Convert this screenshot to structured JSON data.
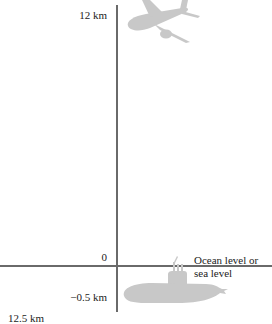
{
  "diagram": {
    "type": "vertical-number-line",
    "axis": {
      "top_label": "12 km",
      "zero_label": "0",
      "negative_label": "−0.5 km",
      "bottom_cut_label": "12.5 km"
    },
    "sea_level_label": {
      "line1": "Ocean level or",
      "line2": "sea level"
    },
    "objects": [
      {
        "name": "airplane",
        "icon": "airplane-icon",
        "position": "top, near 12 km"
      },
      {
        "name": "submarine",
        "icon": "submarine-icon",
        "position": "below sea level, near −0.5 km"
      }
    ],
    "colors": {
      "axis": "#6a6a6a",
      "silhouette": "#c8c8c8",
      "text": "#222222",
      "background": "#ffffff"
    }
  }
}
